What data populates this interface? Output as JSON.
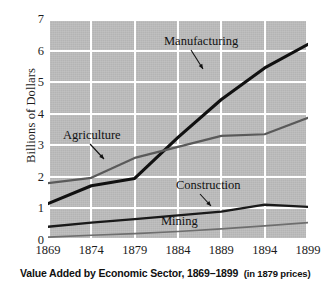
{
  "caption": {
    "main": "Value Added by Economic Sector, 1869–1899",
    "note": "(in 1879 prices)"
  },
  "axes": {
    "y_title": "Billions of Dollars",
    "y_ticks": [
      "0",
      "1",
      "2",
      "3",
      "4",
      "5",
      "6",
      "7"
    ],
    "x_ticks": [
      "1869",
      "1874",
      "1879",
      "1884",
      "1889",
      "1894",
      "1899"
    ]
  },
  "annotations": {
    "manufacturing": "Manufacturing",
    "agriculture": "Agriculture",
    "construction": "Construction",
    "mining": "Mining"
  },
  "colors": {
    "plot_background": "#bdbdbd",
    "gridline": "#ffffff",
    "manufacturing_line": "#111111",
    "agriculture_line": "#5a5a5a",
    "construction_line": "#1a1a1a",
    "mining_line": "#6e6e6e",
    "text": "#1c1c1c",
    "page_background": "#ffffff"
  },
  "chart_data": {
    "type": "line",
    "xlabel": "",
    "ylabel": "Billions of Dollars",
    "x": [
      1869,
      1874,
      1879,
      1884,
      1889,
      1894,
      1899
    ],
    "xlim": [
      1869,
      1899
    ],
    "ylim": [
      0,
      7
    ],
    "ytick_values": [
      0,
      1,
      2,
      3,
      4,
      5,
      6,
      7
    ],
    "grid": true,
    "legend": "none (series labeled inline with leader arrows)",
    "series": [
      {
        "name": "Manufacturing",
        "color": "#111111",
        "values": [
          1.15,
          1.72,
          1.95,
          3.25,
          4.45,
          5.45,
          6.2
        ]
      },
      {
        "name": "Agriculture",
        "color": "#5a5a5a",
        "values": [
          1.8,
          1.97,
          2.6,
          2.95,
          3.3,
          3.35,
          3.87
        ]
      },
      {
        "name": "Construction",
        "color": "#1a1a1a",
        "values": [
          0.42,
          0.55,
          0.66,
          0.78,
          0.9,
          1.12,
          1.05
        ]
      },
      {
        "name": "Mining",
        "color": "#6e6e6e",
        "values": [
          0.09,
          0.15,
          0.2,
          0.27,
          0.35,
          0.45,
          0.55
        ]
      }
    ],
    "annotations": [
      {
        "text": "Manufacturing",
        "points_to_series": "Manufacturing",
        "arrow": "down-right"
      },
      {
        "text": "Agriculture",
        "points_to_series": "Agriculture",
        "arrow": "down-right"
      },
      {
        "text": "Construction",
        "points_to_series": "Construction",
        "arrow": "down-right"
      },
      {
        "text": "Mining",
        "points_to_series": "Mining",
        "arrow": "none"
      }
    ]
  }
}
